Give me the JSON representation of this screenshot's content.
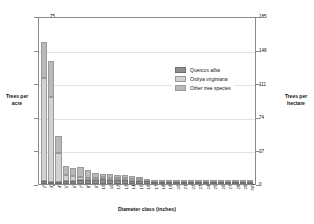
{
  "chart_data": {
    "type": "bar",
    "title": "",
    "subtitle": "",
    "xlabel": "Diameter class (inches)",
    "ylabel": "Trees per acre",
    "ylabel_right": "Trees per hectare",
    "grid": true,
    "stacked": true,
    "legend_position": "inside-top-right",
    "ylim": [
      0,
      75
    ],
    "ylim_right": [
      0,
      185
    ],
    "yticks": [
      0,
      15,
      30,
      45,
      60,
      75
    ],
    "yticks_right": [
      0,
      37,
      74,
      111,
      148,
      185
    ],
    "categories": [
      "2",
      "3",
      "4",
      "5",
      "6",
      "7",
      "8",
      "9",
      "10",
      "11",
      "12",
      "13",
      "14",
      "15",
      "16",
      "17",
      "18",
      "19",
      "20",
      "21",
      "22",
      "23",
      "24",
      "25",
      "26",
      "27",
      "28",
      "29",
      "30+"
    ],
    "series": [
      {
        "name": "Quercus alba",
        "color": "#8e8e8e",
        "values": [
          1.2,
          1.0,
          1.0,
          1.2,
          1.5,
          1.6,
          1.8,
          2.0,
          2.2,
          2.0,
          1.8,
          1.7,
          1.5,
          1.4,
          1.2,
          1.0,
          0.9,
          0.8,
          0.7,
          0.6,
          0.5,
          0.4,
          0.4,
          0.3,
          0.2,
          0.2,
          0.15,
          0.1,
          0.1
        ]
      },
      {
        "name": "Ostrya virginiana",
        "color": "#d2d2d2",
        "values": [
          46.0,
          38.0,
          13.0,
          3.0,
          2.0,
          1.5,
          1.0,
          0.8,
          0.5,
          0.3,
          0.2,
          0.2,
          0.1,
          0.1,
          0.0,
          0.0,
          0.0,
          0.0,
          0.0,
          0.0,
          0.0,
          0.0,
          0.0,
          0.0,
          0.0,
          0.0,
          0.0,
          0.0,
          0.0
        ]
      },
      {
        "name": "Other tree species",
        "color": "#b9b9b9",
        "values": [
          16.0,
          16.0,
          7.5,
          4.0,
          3.5,
          4.5,
          3.5,
          2.0,
          1.5,
          1.5,
          1.3,
          1.5,
          1.2,
          1.0,
          0.8,
          0.7,
          0.7,
          0.6,
          0.6,
          0.5,
          0.3,
          0.4,
          0.3,
          0.2,
          0.2,
          0.2,
          0.1,
          0.1,
          0.4
        ]
      }
    ],
    "totals": [
      63.2,
      55.0,
      21.5,
      8.2,
      7.0,
      7.6,
      6.3,
      4.8,
      4.2,
      3.8,
      3.3,
      3.4,
      2.8,
      2.5,
      2.0,
      1.7,
      1.6,
      1.4,
      1.3,
      1.1,
      0.8,
      0.8,
      0.7,
      0.5,
      0.4,
      0.4,
      0.25,
      0.2,
      0.5
    ]
  },
  "legend": {
    "items": [
      {
        "label": "Quercus alba"
      },
      {
        "label": "Ostrya virginiana"
      },
      {
        "label": "Other tree species"
      }
    ]
  }
}
